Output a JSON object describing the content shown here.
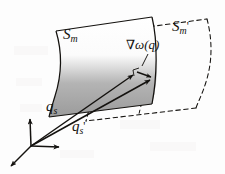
{
  "figure": {
    "name": "surface-gradient-diagram",
    "background_color": "#fdfdfd",
    "ink_color": "#14120f",
    "surface_shade_color": "#9a9a9a",
    "labels": {
      "surface_m": {
        "base": "S",
        "sub": "m",
        "prime": ""
      },
      "surface_m_prime": {
        "base": "S",
        "sub": "m",
        "prime": "'"
      },
      "gradient": {
        "nabla": "∇",
        "omega": "ω",
        "arg": "(q)"
      },
      "vector_qs": {
        "base": "q",
        "sub": "s",
        "prime": ""
      },
      "vector_qs_prime": {
        "base": "q",
        "sub": "s",
        "prime": "'"
      }
    },
    "elements": {
      "solid_surface": "S_m",
      "dashed_surface": "S_m'",
      "gradient_vector": "∇ω(q)",
      "position_vector_1": "q_s",
      "position_vector_2": "q_s'",
      "coordinate_frame": "3-axis origin frame"
    }
  }
}
